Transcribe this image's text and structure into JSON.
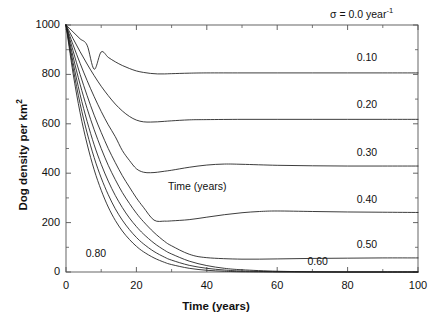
{
  "figure": {
    "background": "#ffffff",
    "line_color": "#1a1a1a",
    "axis_color": "#555555"
  },
  "axes": {
    "xlabel": "Time (years)",
    "ylabel_text": "Dog density per km",
    "ylabel_sup": "2",
    "xticks": [
      "0",
      "20",
      "40",
      "60",
      "80",
      "100"
    ],
    "xtick_values": [
      0,
      20,
      40,
      60,
      80,
      100
    ],
    "yticks": [
      "0",
      "200",
      "400",
      "600",
      "800",
      "1000"
    ],
    "ytick_values": [
      0,
      200,
      400,
      600,
      800,
      1000
    ],
    "xlim": [
      0,
      100
    ],
    "ylim": [
      0,
      1000
    ]
  },
  "annotations": {
    "sigma_prefix": "σ = 0.0 year",
    "sigma_sup": "-1",
    "inner_note": "Time (years)"
  },
  "chart_data": {
    "type": "line",
    "title": "",
    "subtitle": "",
    "xlabel": "Time (years)",
    "ylabel": "Dog density per km2",
    "xlim": [
      0,
      100
    ],
    "ylim": [
      0,
      1000
    ],
    "grid": false,
    "legend": "inline-curve-labels",
    "legend_position": "right",
    "annotations": [
      {
        "text": "σ = 0.0 year-1",
        "x": 78,
        "y": 1060
      },
      {
        "text": "Time (years)",
        "x": 34,
        "y": 330
      }
    ],
    "series": [
      {
        "name": "0.10",
        "label": "0.10",
        "label_x": 86,
        "label_y": 865,
        "plateau": 806,
        "minimum": 800,
        "minimum_time": 22,
        "x": [
          0,
          2,
          4,
          6,
          8,
          10,
          12,
          14,
          16,
          18,
          20,
          22,
          24,
          26,
          28,
          30,
          35,
          40,
          50,
          60,
          70,
          80,
          90,
          100
        ],
        "y": [
          1000,
          972,
          944,
          918,
          821,
          891,
          869,
          851,
          836,
          824,
          814,
          808,
          804,
          802,
          802,
          803,
          805,
          806,
          806,
          806,
          806,
          806,
          806,
          806
        ]
      },
      {
        "name": "0.20",
        "label": "0.20",
        "label_x": 86,
        "label_y": 675,
        "plateau": 618,
        "minimum": 608,
        "minimum_time": 21,
        "x": [
          0,
          2,
          4,
          6,
          8,
          10,
          12,
          14,
          16,
          18,
          20,
          22,
          24,
          26,
          28,
          30,
          35,
          40,
          50,
          60,
          70,
          80,
          90,
          100
        ],
        "y": [
          1000,
          945,
          892,
          842,
          795,
          752,
          714,
          680,
          652,
          630,
          615,
          608,
          607,
          608,
          610,
          612,
          616,
          617,
          618,
          618,
          618,
          618,
          618,
          618
        ]
      },
      {
        "name": "0.30",
        "label": "0.30",
        "label_x": 86,
        "label_y": 480,
        "plateau": 429,
        "minimum": 402,
        "minimum_time": 21,
        "x": [
          0,
          2,
          4,
          6,
          8,
          10,
          12,
          14,
          16,
          18,
          20,
          22,
          24,
          26,
          28,
          30,
          35,
          40,
          45,
          50,
          60,
          70,
          80,
          90,
          100
        ],
        "y": [
          1000,
          920,
          845,
          775,
          710,
          650,
          596,
          548,
          492,
          452,
          418,
          404,
          402,
          404,
          408,
          412,
          424,
          433,
          437,
          436,
          432,
          430,
          429,
          429,
          429
        ]
      },
      {
        "name": "0.40",
        "label": "0.40",
        "label_x": 86,
        "label_y": 290,
        "plateau": 241,
        "minimum": 205,
        "minimum_time": 25,
        "x": [
          0,
          2,
          4,
          6,
          8,
          10,
          12,
          14,
          16,
          18,
          20,
          22,
          25,
          28,
          30,
          35,
          40,
          45,
          50,
          55,
          60,
          70,
          80,
          90,
          100
        ],
        "y": [
          1000,
          896,
          800,
          714,
          635,
          565,
          500,
          443,
          390,
          344,
          300,
          262,
          210,
          206,
          207,
          212,
          222,
          232,
          240,
          245,
          247,
          245,
          243,
          242,
          241
        ]
      },
      {
        "name": "0.50",
        "label": "0.50",
        "label_x": 86,
        "label_y": 110,
        "plateau": 57,
        "minimum": 52,
        "minimum_time": 36,
        "x": [
          0,
          2,
          4,
          6,
          8,
          10,
          12,
          14,
          16,
          18,
          20,
          22,
          25,
          28,
          30,
          35,
          40,
          50,
          60,
          70,
          80,
          90,
          100
        ],
        "y": [
          1000,
          872,
          760,
          662,
          576,
          500,
          432,
          374,
          322,
          278,
          238,
          204,
          160,
          124,
          106,
          72,
          58,
          52,
          53,
          55,
          56,
          57,
          57
        ]
      },
      {
        "name": "0.60",
        "label": "0.60",
        "label_x": 72,
        "label_y": 42,
        "plateau": 0,
        "minimum": 0,
        "minimum_time": 50,
        "x": [
          0,
          2,
          4,
          6,
          8,
          10,
          12,
          14,
          16,
          18,
          20,
          22,
          25,
          28,
          30,
          35,
          40,
          45,
          50,
          60,
          70,
          80,
          90,
          100
        ],
        "y": [
          1000,
          849,
          719,
          610,
          515,
          436,
          368,
          310,
          261,
          219,
          184,
          154,
          117,
          88,
          73,
          44,
          26,
          15,
          9,
          3,
          1,
          0,
          0,
          0
        ]
      },
      {
        "name": "0.70",
        "label": "",
        "plateau": 0,
        "minimum": 0,
        "minimum_time": 45,
        "x": [
          0,
          2,
          4,
          6,
          8,
          10,
          12,
          14,
          16,
          18,
          20,
          22,
          25,
          28,
          30,
          35,
          40,
          45,
          50,
          60,
          70,
          80,
          90,
          100
        ],
        "y": [
          1000,
          827,
          682,
          563,
          463,
          381,
          313,
          256,
          210,
          172,
          140,
          114,
          83,
          60,
          48,
          27,
          15,
          8,
          4,
          1,
          0,
          0,
          0,
          0
        ]
      },
      {
        "name": "0.80",
        "label": "0.80",
        "label_x": 9,
        "label_y": 72,
        "plateau": 0,
        "minimum": 0,
        "minimum_time": 40,
        "x": [
          0,
          2,
          4,
          6,
          8,
          10,
          12,
          14,
          16,
          18,
          20,
          22,
          25,
          28,
          30,
          35,
          40,
          45,
          50,
          60,
          70,
          80,
          90,
          100
        ],
        "y": [
          1000,
          805,
          645,
          518,
          414,
          331,
          263,
          209,
          166,
          132,
          104,
          82,
          57,
          39,
          30,
          15,
          7,
          3,
          1,
          0,
          0,
          0,
          0,
          0
        ]
      }
    ]
  }
}
